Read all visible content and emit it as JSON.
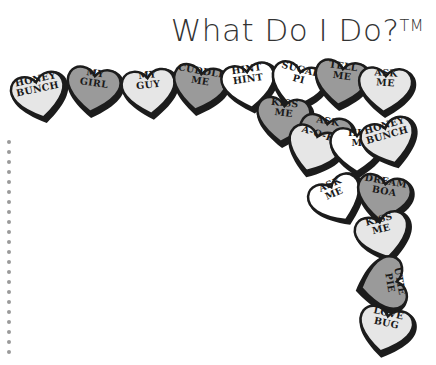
{
  "title": {
    "text": "What Do I Do?",
    "trademark": "TM"
  },
  "colors": {
    "dark_outline": "#1c1c1c",
    "light_fill": "#e6e6e6",
    "mid_fill": "#9a9a9a",
    "white_fill": "#ffffff",
    "dots": "#9a9a9a"
  },
  "hearts": [
    {
      "label1": "HONEY",
      "label2": "BUNCH"
    },
    {
      "label1": "MY",
      "label2": "GIRL"
    },
    {
      "label1": "MY",
      "label2": "GUY"
    },
    {
      "label1": "CUDDLE",
      "label2": "ME"
    },
    {
      "label1": "HINT",
      "label2": "HINT"
    },
    {
      "label1": "SUGAR",
      "label2": "PI"
    },
    {
      "label1": "KISS",
      "label2": "ME"
    },
    {
      "label1": "TELL",
      "label2": "ME"
    },
    {
      "label1": "ASK",
      "label2": "ME"
    },
    {
      "label1": "ASK",
      "label2": ""
    },
    {
      "label1": "A-O-K",
      "label2": ""
    },
    {
      "label1": "HU",
      "label2": "M"
    },
    {
      "label1": "HONEY",
      "label2": "BUNCH"
    },
    {
      "label1": "ASK",
      "label2": "ME"
    },
    {
      "label1": "DREAM",
      "label2": "BOA"
    },
    {
      "label1": "KISS",
      "label2": "ME"
    },
    {
      "label1": "UTIE",
      "label2": "PIE"
    },
    {
      "label1": "LOVE",
      "label2": "BUG"
    }
  ],
  "dot_count": 22
}
